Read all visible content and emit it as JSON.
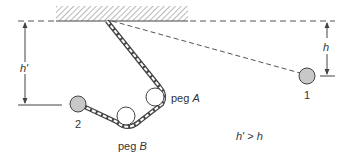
{
  "diagram": {
    "type": "physics-pendulum-chain",
    "ceiling": {
      "label": ""
    },
    "labels": {
      "h": "h",
      "h_prime": "h′",
      "ball_1": "1",
      "ball_2": "2",
      "peg_a_prefix": "peg ",
      "peg_a_letter": "A",
      "peg_b_prefix": "peg ",
      "peg_b_letter": "B",
      "relation_left": "h′",
      "relation_op": " > ",
      "relation_right": "h"
    },
    "colors": {
      "ball_fill": "#c8c8c8",
      "stroke": "#444444",
      "hatch": "#777777"
    }
  }
}
